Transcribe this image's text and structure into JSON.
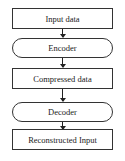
{
  "diagram": {
    "type": "flowchart",
    "direction": "top-to-bottom",
    "nodes": [
      {
        "id": "input",
        "label": "Input data",
        "shape": "rectangle"
      },
      {
        "id": "encoder",
        "label": "Encoder",
        "shape": "stadium"
      },
      {
        "id": "compressed",
        "label": "Compressed data",
        "shape": "rectangle"
      },
      {
        "id": "decoder",
        "label": "Decoder",
        "shape": "stadium"
      },
      {
        "id": "output",
        "label": "Reconstructed Input",
        "shape": "rectangle"
      }
    ],
    "edges": [
      {
        "from": "input",
        "to": "encoder"
      },
      {
        "from": "encoder",
        "to": "compressed"
      },
      {
        "from": "compressed",
        "to": "decoder"
      },
      {
        "from": "decoder",
        "to": "output"
      }
    ]
  }
}
